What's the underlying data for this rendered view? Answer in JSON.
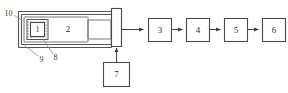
{
  "figure": {
    "type": "schematic-block-diagram",
    "background_color": "#ffffff",
    "line_color": "#4a4a4a",
    "label_color": "#2b2b2b"
  },
  "chamber": {
    "name": "chamber-assembly",
    "reference_labels": {
      "outer_wall": "10",
      "inner_wall": "9",
      "sample_holder": "8"
    },
    "components": {
      "sample": "1",
      "cavity": "2"
    }
  },
  "window_bar": {
    "name": "window-plate"
  },
  "blocks": [
    {
      "id": "b3",
      "label": "3"
    },
    {
      "id": "b4",
      "label": "4"
    },
    {
      "id": "b5",
      "label": "5"
    },
    {
      "id": "b6",
      "label": "6"
    }
  ],
  "lower_block": {
    "label": "7"
  },
  "arrows": {
    "output_arrow": "right",
    "feed_arrow": "up",
    "chain_arrow": "right"
  }
}
